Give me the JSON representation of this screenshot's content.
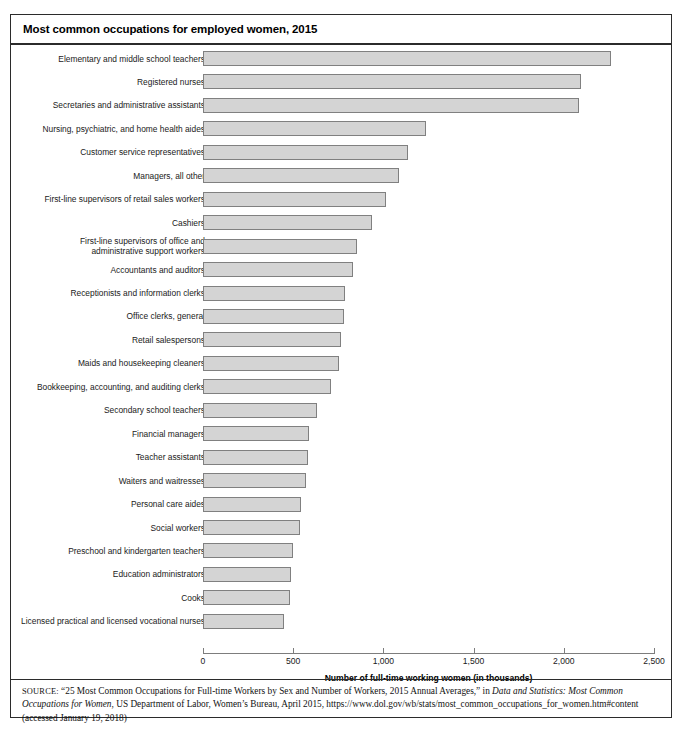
{
  "figure": {
    "title": "Most common occupations for employed women, 2015"
  },
  "source": {
    "prefix": "SOURCE:",
    "part1": " “25 Most Common Occupations for Full-time Workers by Sex and Number of Workers, 2015 Annual Averages,” in ",
    "italic1": "Data and Statistics: Most Common Occupations for Women",
    "part2": ", US Department of Labor, Women’s Bureau, April 2015, https://www.dol.gov/wb/stats/most_common_occupations_for_women.htm#content (accessed January 19, 2018)"
  },
  "chart_data": {
    "type": "bar",
    "orientation": "horizontal",
    "title": "Most common occupations for employed women, 2015",
    "xlabel": "Number of full-time working women (in thousands)",
    "ylabel": "",
    "xlim": [
      0,
      2500
    ],
    "xticks": [
      0,
      500,
      1000,
      1500,
      2000,
      2500
    ],
    "xtick_labels": [
      "0",
      "500",
      "1,000",
      "1,500",
      "2,000",
      "2,500"
    ],
    "grid": false,
    "legend": false,
    "bar_fill": "#d4d4d4",
    "bar_edge": "#808080",
    "categories": [
      "Elementary and middle school teachers",
      "Registered nurses",
      "Secretaries and administrative assistants",
      "Nursing, psychiatric, and home health aides",
      "Customer service representatives",
      "Managers, all other",
      "First-line supervisors of retail sales workers",
      "Cashiers",
      "First-line supervisors of office and\nadministrative support workers",
      "Accountants and auditors",
      "Receptionists and information clerks",
      "Office clerks, general",
      "Retail salespersons",
      "Maids and housekeeping cleaners",
      "Bookkeeping, accounting, and auditing clerks",
      "Secondary school teachers",
      "Financial managers",
      "Teacher assistants",
      "Waiters and waitresses",
      "Personal care aides",
      "Social workers",
      "Preschool and kindergarten teachers",
      "Education administrators",
      "Cooks",
      "Licensed practical and licensed vocational nurses"
    ],
    "values": [
      2260,
      2095,
      2085,
      1236,
      1136,
      1086,
      1014,
      937,
      854,
      831,
      787,
      781,
      765,
      754,
      710,
      632,
      588,
      582,
      571,
      543,
      540,
      499,
      488,
      482,
      449
    ]
  }
}
